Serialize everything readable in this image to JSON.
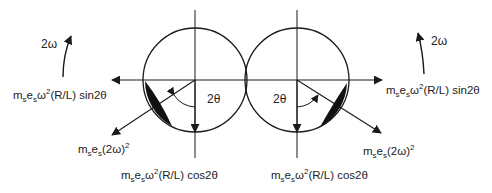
{
  "diagram": {
    "type": "balancer-force-diagram",
    "colors": {
      "line": "#1a1a1a",
      "text": "#222222",
      "background": "#ffffff"
    },
    "left": {
      "rotation_label": "2ω",
      "horizontal_force": {
        "m": "m",
        "s1": "s",
        "e": "e",
        "s2": "s",
        "rest": "ω",
        "sup": "2",
        "tail": "(R/L) sin2θ"
      },
      "vertical_force": {
        "m": "m",
        "s1": "s",
        "e": "e",
        "s2": "s",
        "rest": "ω",
        "sup": "2",
        "tail": "(R/L) cos2θ"
      },
      "resultant_force": {
        "m": "m",
        "s1": "s",
        "e": "e",
        "s2": "s",
        "rest": "(2ω)",
        "sup": "2"
      },
      "angle_label": "2θ"
    },
    "right": {
      "rotation_label": "2ω",
      "horizontal_force": {
        "m": "m",
        "s1": "s",
        "e": "e",
        "s2": "s",
        "rest": "ω",
        "sup": "2",
        "tail": "(R/L) sin2θ"
      },
      "vertical_force": {
        "m": "m",
        "s1": "s",
        "e": "e",
        "s2": "s",
        "rest": "ω",
        "sup": "2",
        "tail": "(R/L) cos2θ"
      },
      "resultant_force": {
        "m": "m",
        "s1": "s",
        "e": "e",
        "s2": "s",
        "rest": "(2ω)",
        "sup": "2"
      },
      "angle_label": "2θ"
    }
  }
}
